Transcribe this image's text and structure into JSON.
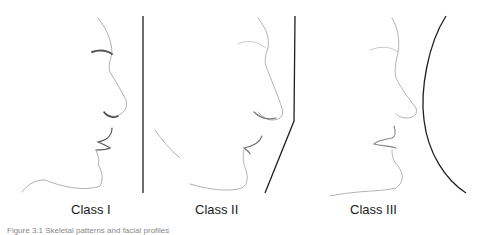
{
  "figure": {
    "panels": [
      {
        "label": "Class I",
        "reference_line": "straight-vertical"
      },
      {
        "label": "Class II",
        "reference_line": "angled-convex"
      },
      {
        "label": "Class III",
        "reference_line": "concave-curve"
      }
    ],
    "caption": "Figure 3.1 Skeletal patterns and facial profiles"
  },
  "colors": {
    "line": "#1f1f1f",
    "sketch": "#8a8a8a",
    "background": "#ffffff"
  }
}
